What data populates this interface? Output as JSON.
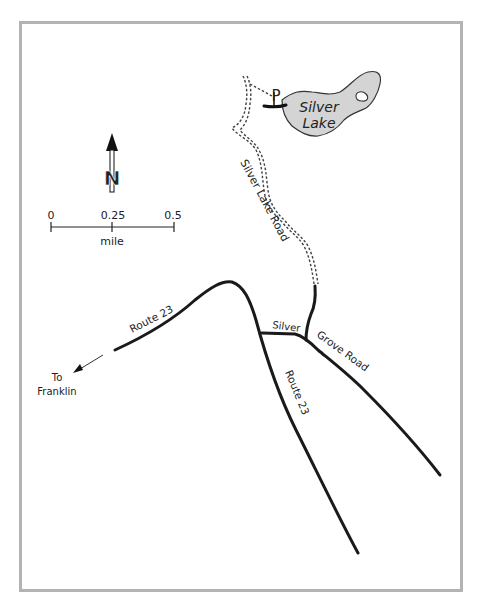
{
  "map": {
    "lake": {
      "name_line1": "Silver",
      "name_line2": "Lake",
      "fill": "#d4d4d4"
    },
    "parking_symbol": "P",
    "roads": {
      "silver_lake_road": "Silver Lake Road",
      "route23_west": "Route 23",
      "route23_south": "Route 23",
      "silver_grove_part1": "Silver",
      "silver_grove_part2": "Grove Road"
    },
    "direction": {
      "line1": "To",
      "line2": "Franklin"
    },
    "north_arrow": {
      "label": "N"
    },
    "scale_bar": {
      "ticks": [
        "0",
        "0.25",
        "0.5"
      ],
      "unit": "mile"
    },
    "colors": {
      "border": "#b3b3b3",
      "road": "#1a1a1a",
      "lake": "#d4d4d4"
    }
  }
}
